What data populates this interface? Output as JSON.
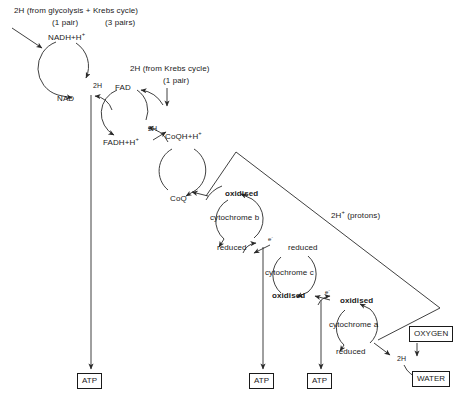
{
  "inputs": {
    "glycolysis_krebs": {
      "line1": "2H (from glycolysis + Krebs cycle)",
      "pairs_left": "(1 pair)",
      "pairs_right": "(3 pairs)"
    },
    "krebs_only": {
      "line1": "2H (from Krebs cycle)",
      "pairs": "(1 pair)"
    }
  },
  "carriers": [
    {
      "name": "nad-cycle",
      "top_label": "NADH+H",
      "top_sup": "+",
      "bottom_label": "NAD",
      "center_label": ""
    },
    {
      "name": "fad-cycle",
      "top_label": "FAD",
      "top_sup": "",
      "bottom_label": "FADH+H",
      "bottom_sup": "+",
      "center_label": ""
    },
    {
      "name": "coq-cycle",
      "top_label": "CoQH+H",
      "top_sup": "+",
      "bottom_label": "CoQ",
      "center_label": ""
    }
  ],
  "cytochromes": [
    {
      "name": "cytochrome-b",
      "center_label": "cytochrome b",
      "top_label": "oxidised",
      "bottom_label": "reduced",
      "top_bold": true,
      "bottom_bold": false
    },
    {
      "name": "cytochrome-c",
      "center_label": "cytochrome c",
      "top_label": "reduced",
      "bottom_label": "oxidised",
      "top_bold": false,
      "bottom_bold": true
    },
    {
      "name": "cytochrome-a",
      "center_label": "cytochrome a",
      "top_label": "oxidised",
      "bottom_label": "reduced",
      "top_bold": true,
      "bottom_bold": false
    }
  ],
  "transfer_labels": {
    "h_transfer_1": "2H",
    "h_transfer_2": "2H",
    "electron_1": "e",
    "electron_1_sup": "-",
    "electron_2": "e",
    "electron_2_sup": "-",
    "electron_3": "e",
    "electron_3_sup": "-",
    "protons": "2H",
    "protons_sup": "+",
    "protons_word": "(protons)",
    "final_2h": "2H"
  },
  "products": {
    "atp_1": "ATP",
    "atp_2": "ATP",
    "atp_3": "ATP",
    "oxygen": "OXYGEN",
    "water": "WATER"
  },
  "colors": {
    "stroke": "#2a2a2a",
    "text": "#1a1a1a",
    "background": "#ffffff"
  }
}
